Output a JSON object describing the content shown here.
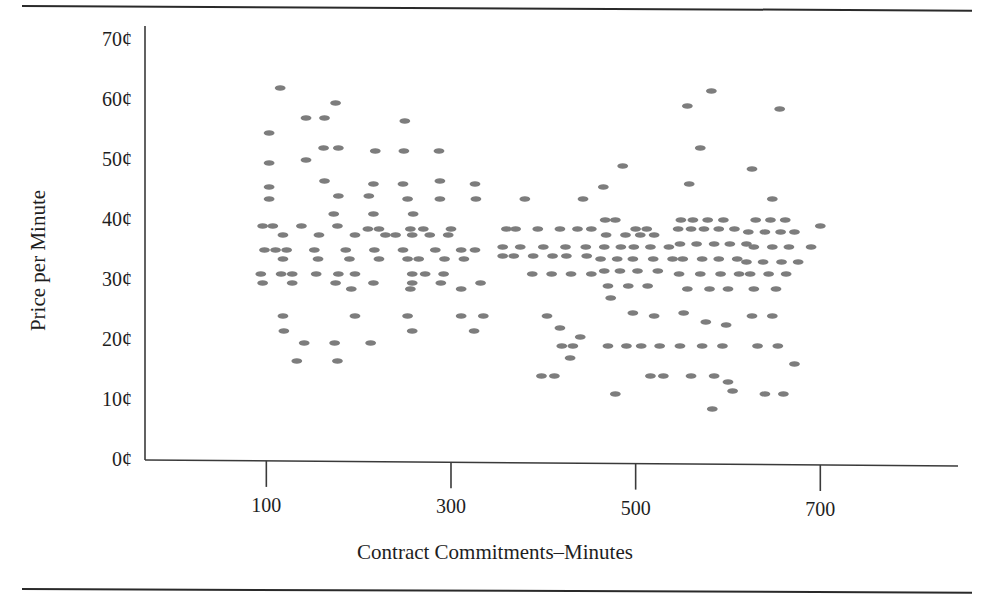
{
  "figure": {
    "background": "#ffffff",
    "rule_color": "#2a2a2a",
    "axis_color": "#3a3a3a",
    "marker_color": "#7d7d7d"
  },
  "axis_titles": {
    "x": "Contract Commitments–Minutes",
    "y": "Price per Minute"
  },
  "y_ticks": [
    {
      "label": "70¢",
      "value": 70
    },
    {
      "label": "60¢",
      "value": 60
    },
    {
      "label": "50¢",
      "value": 50
    },
    {
      "label": "40¢",
      "value": 40
    },
    {
      "label": "30¢",
      "value": 30
    },
    {
      "label": "20¢",
      "value": 20
    },
    {
      "label": "10¢",
      "value": 10
    },
    {
      "label": "0¢",
      "value": 0
    }
  ],
  "x_ticks": [
    {
      "label": "100",
      "value": 100
    },
    {
      "label": "300",
      "value": 300
    },
    {
      "label": "500",
      "value": 500
    },
    {
      "label": "700",
      "value": 700
    }
  ],
  "chart_data": {
    "type": "scatter",
    "title": "",
    "xlabel": "Contract Commitments–Minutes",
    "ylabel": "Price per Minute",
    "xlim": [
      0,
      760
    ],
    "ylim": [
      0,
      72
    ],
    "grid": false,
    "legend": null,
    "marker": "flat-ellipse",
    "marker_color": "#7d7d7d",
    "y_unit": "cents",
    "x_unit": "minutes",
    "points": [
      [
        115,
        62.0
      ],
      [
        103,
        54.5
      ],
      [
        175,
        59.5
      ],
      [
        143,
        57.0
      ],
      [
        163,
        57.0
      ],
      [
        250,
        56.5
      ],
      [
        103,
        49.5
      ],
      [
        162,
        52.0
      ],
      [
        178,
        52.0
      ],
      [
        218,
        51.5
      ],
      [
        249,
        51.5
      ],
      [
        287,
        51.5
      ],
      [
        143,
        50.0
      ],
      [
        163,
        46.5
      ],
      [
        103,
        45.5
      ],
      [
        216,
        46.0
      ],
      [
        248,
        46.0
      ],
      [
        288,
        46.5
      ],
      [
        326,
        46.0
      ],
      [
        178,
        44.0
      ],
      [
        103,
        43.5
      ],
      [
        211,
        44.0
      ],
      [
        253,
        43.5
      ],
      [
        288,
        43.5
      ],
      [
        327,
        43.5
      ],
      [
        173,
        41.0
      ],
      [
        216,
        41.0
      ],
      [
        259,
        41.0
      ],
      [
        96,
        39.0
      ],
      [
        107,
        39.0
      ],
      [
        138,
        39.0
      ],
      [
        177,
        39.0
      ],
      [
        210,
        38.5
      ],
      [
        222,
        38.5
      ],
      [
        256,
        38.5
      ],
      [
        270,
        38.5
      ],
      [
        300,
        38.5
      ],
      [
        118,
        37.5
      ],
      [
        157,
        37.5
      ],
      [
        196,
        37.5
      ],
      [
        229,
        37.5
      ],
      [
        240,
        37.5
      ],
      [
        258,
        37.5
      ],
      [
        277,
        37.5
      ],
      [
        297,
        37.5
      ],
      [
        98,
        35.0
      ],
      [
        110,
        35.0
      ],
      [
        122,
        35.0
      ],
      [
        152,
        35.0
      ],
      [
        186,
        35.0
      ],
      [
        217,
        35.0
      ],
      [
        248,
        35.0
      ],
      [
        283,
        35.0
      ],
      [
        311,
        35.0
      ],
      [
        326,
        35.0
      ],
      [
        118,
        33.5
      ],
      [
        156,
        33.5
      ],
      [
        190,
        33.5
      ],
      [
        222,
        33.5
      ],
      [
        253,
        33.5
      ],
      [
        265,
        33.5
      ],
      [
        293,
        33.5
      ],
      [
        314,
        33.5
      ],
      [
        94,
        31.0
      ],
      [
        116,
        31.0
      ],
      [
        128,
        31.0
      ],
      [
        154,
        31.0
      ],
      [
        178,
        31.0
      ],
      [
        196,
        31.0
      ],
      [
        258,
        31.0
      ],
      [
        272,
        31.0
      ],
      [
        292,
        31.0
      ],
      [
        96,
        29.5
      ],
      [
        128,
        29.5
      ],
      [
        175,
        29.5
      ],
      [
        216,
        29.5
      ],
      [
        258,
        29.5
      ],
      [
        289,
        29.5
      ],
      [
        332,
        29.5
      ],
      [
        192,
        28.5
      ],
      [
        256,
        28.5
      ],
      [
        311,
        28.5
      ],
      [
        118,
        24.0
      ],
      [
        196,
        24.0
      ],
      [
        253,
        24.0
      ],
      [
        311,
        24.0
      ],
      [
        335,
        24.0
      ],
      [
        119,
        21.5
      ],
      [
        258,
        21.5
      ],
      [
        325,
        21.5
      ],
      [
        141,
        19.5
      ],
      [
        174,
        19.5
      ],
      [
        213,
        19.5
      ],
      [
        133,
        16.5
      ],
      [
        177,
        16.5
      ],
      [
        420,
        19.0
      ],
      [
        432,
        19.0
      ],
      [
        360,
        38.5
      ],
      [
        370,
        38.5
      ],
      [
        394,
        38.5
      ],
      [
        418,
        38.5
      ],
      [
        437,
        38.5
      ],
      [
        452,
        38.5
      ],
      [
        380,
        43.5
      ],
      [
        443,
        43.5
      ],
      [
        467,
        40.0
      ],
      [
        478,
        40.0
      ],
      [
        356,
        34.0
      ],
      [
        368,
        34.0
      ],
      [
        389,
        34.0
      ],
      [
        410,
        34.0
      ],
      [
        425,
        34.0
      ],
      [
        447,
        34.0
      ],
      [
        388,
        31.0
      ],
      [
        409,
        31.0
      ],
      [
        430,
        31.0
      ],
      [
        452,
        31.0
      ],
      [
        356,
        35.5
      ],
      [
        375,
        35.5
      ],
      [
        400,
        35.5
      ],
      [
        424,
        35.5
      ],
      [
        446,
        35.5
      ],
      [
        404,
        24.0
      ],
      [
        418,
        22.0
      ],
      [
        440,
        20.5
      ],
      [
        398,
        14.0
      ],
      [
        412,
        14.0
      ],
      [
        429,
        17.0
      ],
      [
        465,
        45.5
      ],
      [
        486,
        49.0
      ],
      [
        500,
        38.5
      ],
      [
        512,
        38.5
      ],
      [
        468,
        37.5
      ],
      [
        489,
        37.5
      ],
      [
        505,
        37.5
      ],
      [
        520,
        37.5
      ],
      [
        466,
        35.5
      ],
      [
        484,
        35.5
      ],
      [
        498,
        35.5
      ],
      [
        516,
        35.5
      ],
      [
        536,
        35.5
      ],
      [
        462,
        33.5
      ],
      [
        480,
        33.5
      ],
      [
        497,
        33.5
      ],
      [
        519,
        33.5
      ],
      [
        540,
        33.5
      ],
      [
        466,
        31.5
      ],
      [
        483,
        31.5
      ],
      [
        502,
        31.5
      ],
      [
        524,
        31.5
      ],
      [
        470,
        29.0
      ],
      [
        492,
        29.0
      ],
      [
        513,
        29.0
      ],
      [
        473,
        27.0
      ],
      [
        497,
        24.5
      ],
      [
        520,
        24.0
      ],
      [
        470,
        19.0
      ],
      [
        490,
        19.0
      ],
      [
        506,
        19.0
      ],
      [
        526,
        19.0
      ],
      [
        478,
        11.0
      ],
      [
        516,
        14.0
      ],
      [
        530,
        14.0
      ],
      [
        556,
        59.0
      ],
      [
        582,
        61.5
      ],
      [
        570,
        52.0
      ],
      [
        558,
        46.0
      ],
      [
        549,
        40.0
      ],
      [
        562,
        40.0
      ],
      [
        578,
        40.0
      ],
      [
        595,
        40.0
      ],
      [
        546,
        38.5
      ],
      [
        560,
        38.5
      ],
      [
        574,
        38.5
      ],
      [
        590,
        38.5
      ],
      [
        607,
        38.5
      ],
      [
        548,
        36.0
      ],
      [
        566,
        36.0
      ],
      [
        585,
        36.0
      ],
      [
        602,
        36.0
      ],
      [
        620,
        36.0
      ],
      [
        551,
        33.5
      ],
      [
        572,
        33.5
      ],
      [
        590,
        33.5
      ],
      [
        610,
        33.5
      ],
      [
        547,
        31.0
      ],
      [
        570,
        31.0
      ],
      [
        592,
        31.0
      ],
      [
        612,
        31.0
      ],
      [
        556,
        28.5
      ],
      [
        580,
        28.5
      ],
      [
        600,
        28.5
      ],
      [
        552,
        24.5
      ],
      [
        576,
        23.0
      ],
      [
        598,
        22.5
      ],
      [
        548,
        19.0
      ],
      [
        572,
        19.0
      ],
      [
        594,
        19.0
      ],
      [
        560,
        14.0
      ],
      [
        585,
        14.0
      ],
      [
        605,
        11.5
      ],
      [
        583,
        8.5
      ],
      [
        600,
        13.0
      ],
      [
        626,
        48.5
      ],
      [
        656,
        58.5
      ],
      [
        648,
        43.5
      ],
      [
        630,
        40.0
      ],
      [
        646,
        40.0
      ],
      [
        662,
        40.0
      ],
      [
        622,
        38.0
      ],
      [
        640,
        38.0
      ],
      [
        657,
        38.0
      ],
      [
        672,
        38.0
      ],
      [
        628,
        35.5
      ],
      [
        648,
        35.5
      ],
      [
        666,
        35.5
      ],
      [
        620,
        33.0
      ],
      [
        638,
        33.0
      ],
      [
        658,
        33.0
      ],
      [
        676,
        33.0
      ],
      [
        624,
        31.0
      ],
      [
        644,
        31.0
      ],
      [
        663,
        31.0
      ],
      [
        628,
        28.5
      ],
      [
        652,
        28.5
      ],
      [
        626,
        24.0
      ],
      [
        648,
        24.0
      ],
      [
        632,
        19.0
      ],
      [
        654,
        19.0
      ],
      [
        672,
        16.0
      ],
      [
        640,
        11.0
      ],
      [
        660,
        11.0
      ],
      [
        690,
        35.5
      ],
      [
        700,
        39.0
      ]
    ]
  }
}
